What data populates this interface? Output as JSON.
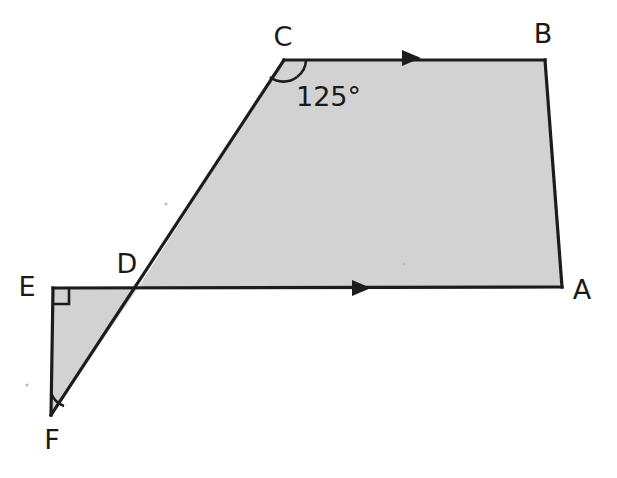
{
  "figure": {
    "type": "geometry-diagram",
    "background_color": "#ffffff",
    "fill_color": "#d2d2d2",
    "stroke_color": "#1c1c1c",
    "labels": {
      "A": "A",
      "B": "B",
      "C": "C",
      "D": "D",
      "E": "E",
      "F": "F"
    },
    "angle_labels": {
      "at_C": "125°"
    },
    "points": {
      "A": {
        "x": 562,
        "y": 287
      },
      "B": {
        "x": 545,
        "y": 60
      },
      "C": {
        "x": 284,
        "y": 60
      },
      "D": {
        "x": 138,
        "y": 288
      },
      "E": {
        "x": 53,
        "y": 288
      },
      "F": {
        "x": 51,
        "y": 415
      }
    },
    "label_positions": {
      "A": {
        "x": 582,
        "y": 291
      },
      "B": {
        "x": 543,
        "y": 35
      },
      "C": {
        "x": 283,
        "y": 38
      },
      "D": {
        "x": 127,
        "y": 265
      },
      "E": {
        "x": 27,
        "y": 288
      },
      "F": {
        "x": 52,
        "y": 441
      },
      "angle_125": {
        "x": 296,
        "y": 98
      }
    },
    "markers": {
      "right_angle_at": "E",
      "arc_angles": [
        "C",
        "F"
      ],
      "parallel_arrows": [
        {
          "on_segment": "CB",
          "x": 412,
          "y": 58,
          "direction": "right"
        },
        {
          "on_segment": "DA",
          "x": 362,
          "y": 288,
          "direction": "right"
        }
      ]
    },
    "segments": [
      "C-B",
      "B-A",
      "A-D",
      "D-C",
      "C-F",
      "E-F",
      "E-D",
      "E-A"
    ]
  }
}
